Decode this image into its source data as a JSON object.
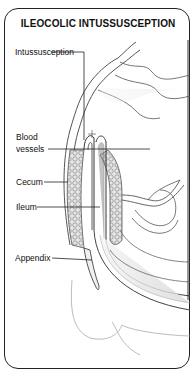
{
  "diagram": {
    "title": "ILEOCOLIC INTUSSUSCEPTION",
    "labels": [
      {
        "id": "intussusception",
        "text": "Intussusception"
      },
      {
        "id": "blood-vessels",
        "text": "Blood vessels",
        "lines": [
          "Blood",
          "vessels"
        ]
      },
      {
        "id": "cecum",
        "text": "Cecum"
      },
      {
        "id": "ileum",
        "text": "Ileum"
      },
      {
        "id": "appendix",
        "text": "Appendix"
      }
    ]
  }
}
